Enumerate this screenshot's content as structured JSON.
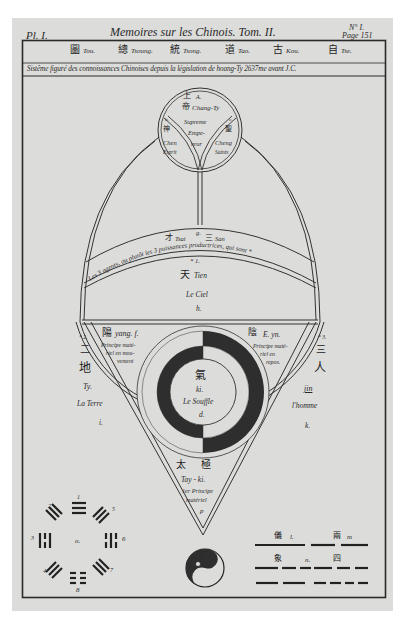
{
  "plate": {
    "plate_label": "Pl. I.",
    "running_title": "Memoires sur les Chinois. Tom. II.",
    "number_label": "N° I.",
    "page_label": "Page 151"
  },
  "header": {
    "terms": [
      {
        "char": "圖",
        "roman": "Tou."
      },
      {
        "char": "總",
        "roman": "Tsoung."
      },
      {
        "char": "統",
        "roman": "Tsong."
      },
      {
        "char": "道",
        "roman": "Tao."
      },
      {
        "char": "古",
        "roman": "Kou."
      },
      {
        "char": "自",
        "roman": "Tse."
      }
    ],
    "subtitle": "Sistême figuré des connoissances Chinoises depuis la législation de hoang-Ty 2637me avant J.C."
  },
  "top_circle": {
    "center": {
      "char_top": "上",
      "char": "帝",
      "letter": "A.",
      "roman": "Chang-Ty",
      "line1": "Supreme",
      "line2": "Empe-",
      "line3": "reur"
    },
    "left": {
      "letter": "b.",
      "char": "神",
      "roman": "Chen",
      "meaning": "Esprit"
    },
    "right": {
      "letter": "c.",
      "char": "聖",
      "roman": "Cheng",
      "meaning": "Saints"
    }
  },
  "band": {
    "top_label_char_left": "才",
    "top_label_left": "Tsai",
    "top_label_letter": "g.",
    "top_label_char_right": "三",
    "top_label_right": "San",
    "arc_text": "Les 3 agents, ou plutôt les 3 puissances productrices, qui sont *"
  },
  "heaven": {
    "number": "* 1.",
    "char": "天",
    "roman": "Tien",
    "french": "Le Ciel",
    "letter": "h."
  },
  "earth": {
    "number": "* 2.",
    "char_top": "二",
    "char": "地",
    "roman": "Ty.",
    "french": "La Terre",
    "letter": "i."
  },
  "man": {
    "number": "* 3.",
    "char_top": "三",
    "char": "人",
    "roman": "jin",
    "french": "l'homme",
    "letter": "k."
  },
  "yang": {
    "char": "陽",
    "roman": "yang. f.",
    "line1": "Principe maté-",
    "line2": "riel en mou-",
    "line3": "vement"
  },
  "yin": {
    "char": "陰",
    "roman": "E. yn.",
    "line1": "Principe maté-",
    "line2": "riel en",
    "line3": "repos."
  },
  "breath": {
    "char": "氣",
    "roman": "ki.",
    "french": "Le Souffle",
    "letter": "d."
  },
  "taiji": {
    "char1": "太",
    "char2": "極",
    "roman": "Tay - ki.",
    "line1": "1er Principe",
    "line2": "matériel",
    "letter": "p"
  },
  "trigrams": {
    "center_letter": "o.",
    "numbers": [
      "1",
      "2",
      "3",
      "4",
      "5",
      "6",
      "7",
      "8"
    ]
  },
  "yinyang_symbol": {
    "letter": "p"
  },
  "lines_legend": {
    "row1": {
      "char_left": "儀",
      "letter_left": "l.",
      "char_right": "兩",
      "letter_right": "m"
    },
    "row2": {
      "char_left": "象",
      "letter_center": "n.",
      "char_right": "四"
    }
  },
  "colors": {
    "paper": "#dcdcda",
    "ink": "#2a2a2a",
    "ring_dark": "#2e2e2e",
    "border": "#ffffff"
  }
}
